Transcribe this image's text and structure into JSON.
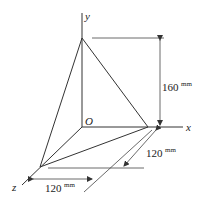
{
  "diagram": {
    "type": "3d-tetrahedron-dimensioned",
    "axes": {
      "x_label": "x",
      "y_label": "y",
      "z_label": "z",
      "origin_label": "O"
    },
    "dimensions": {
      "height": {
        "value": "160",
        "unit": "mm"
      },
      "x_extent": {
        "value": "120",
        "unit": "mm"
      },
      "z_extent": {
        "value": "120",
        "unit": "mm"
      }
    }
  }
}
